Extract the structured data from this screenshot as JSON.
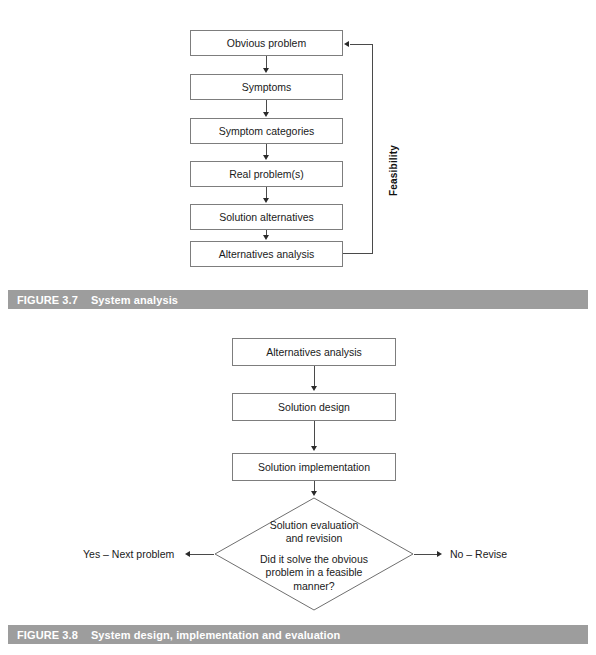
{
  "figures": [
    {
      "id": "figure-3-7",
      "caption_number": "FIGURE 3.7",
      "caption_title": "System analysis",
      "type": "flowchart",
      "side_label": "Feasibility",
      "nodes": [
        {
          "id": "obvious-problem",
          "label": "Obvious problem",
          "shape": "rect"
        },
        {
          "id": "symptoms",
          "label": "Symptoms",
          "shape": "rect"
        },
        {
          "id": "symptom-categories",
          "label": "Symptom categories",
          "shape": "rect"
        },
        {
          "id": "real-problems",
          "label": "Real problem(s)",
          "shape": "rect"
        },
        {
          "id": "solution-alternatives",
          "label": "Solution alternatives",
          "shape": "rect"
        },
        {
          "id": "alternatives-analysis",
          "label": "Alternatives analysis",
          "shape": "rect"
        }
      ],
      "edges": [
        {
          "from": "obvious-problem",
          "to": "symptoms",
          "style": "arrow-down"
        },
        {
          "from": "symptoms",
          "to": "symptom-categories",
          "style": "arrow-down"
        },
        {
          "from": "symptom-categories",
          "to": "real-problems",
          "style": "arrow-down"
        },
        {
          "from": "real-problems",
          "to": "solution-alternatives",
          "style": "arrow-down"
        },
        {
          "from": "solution-alternatives",
          "to": "alternatives-analysis",
          "style": "arrow-down"
        },
        {
          "from": "alternatives-analysis",
          "to": "obvious-problem",
          "style": "feedback-loop",
          "label": "Feasibility"
        }
      ]
    },
    {
      "id": "figure-3-8",
      "caption_number": "FIGURE 3.8",
      "caption_title": "System design, implementation and evaluation",
      "type": "flowchart",
      "nodes": [
        {
          "id": "alternatives-analysis",
          "label": "Alternatives analysis",
          "shape": "rect"
        },
        {
          "id": "solution-design",
          "label": "Solution design",
          "shape": "rect"
        },
        {
          "id": "solution-implementation",
          "label": "Solution implementation",
          "shape": "rect"
        },
        {
          "id": "solution-evaluation",
          "shape": "diamond",
          "label_line_1": "Solution evaluation",
          "label_line_2": "and revision",
          "label_line_3": "Did it solve the obvious",
          "label_line_4": "problem in a feasible",
          "label_line_5": "manner?"
        }
      ],
      "edges": [
        {
          "from": "alternatives-analysis",
          "to": "solution-design",
          "style": "arrow-down"
        },
        {
          "from": "solution-design",
          "to": "solution-implementation",
          "style": "arrow-down"
        },
        {
          "from": "solution-implementation",
          "to": "solution-evaluation",
          "style": "arrow-down"
        },
        {
          "from": "solution-evaluation",
          "to": "yes-branch",
          "style": "arrow-left",
          "label": "Yes – Next problem"
        },
        {
          "from": "solution-evaluation",
          "to": "no-branch",
          "style": "arrow-right",
          "label": "No – Revise"
        }
      ],
      "branch_yes_label": "Yes – Next problem",
      "branch_no_label": "No – Revise"
    }
  ],
  "colors": {
    "caption_bar_bg": "#9d9d9d",
    "caption_text": "#ffffff",
    "box_border": "#7d7d7d",
    "line": "#4a4a4a",
    "text": "#1a1a1a",
    "page_bg": "#ffffff"
  }
}
